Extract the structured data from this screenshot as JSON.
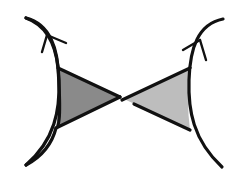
{
  "diagram": {
    "colors": {
      "background": "#ffffff",
      "stroke": "#111111",
      "left_wedge_fill": "#8a8a8a",
      "right_wedge_fill": "#bdbdbd"
    },
    "elements": [
      {
        "id": "left-curve",
        "shape": "curve",
        "orientation": "bows-right",
        "arrow": "up"
      },
      {
        "id": "left-wedge",
        "shape": "triangle",
        "fill": "dark-gray"
      },
      {
        "id": "right-curve",
        "shape": "curve",
        "orientation": "bows-left",
        "arrow": "up"
      },
      {
        "id": "right-wedge",
        "shape": "triangle",
        "fill": "light-gray"
      }
    ]
  }
}
